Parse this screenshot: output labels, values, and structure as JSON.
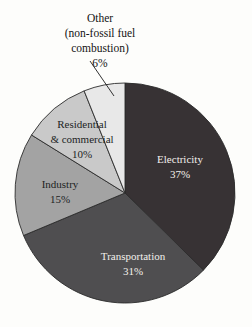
{
  "chart_data": {
    "type": "pie",
    "title": "",
    "subtitle": "",
    "xlabel": "",
    "ylabel": "",
    "legend_position": "none",
    "grid": false,
    "start_angle_deg": 0,
    "direction": "clockwise",
    "unit": "%",
    "categories": [
      "Electricity",
      "Transportation",
      "Industry",
      "Residential & commercial",
      "Other (non-fossil fuel combustion)"
    ],
    "values": [
      37,
      31,
      15,
      10,
      6
    ],
    "slices": [
      {
        "id": "electricity",
        "label": "Electricity",
        "value": 37,
        "value_label": "37%",
        "color": "#373234",
        "text_color": "#f2f0ec",
        "label_placement": "inside"
      },
      {
        "id": "transportation",
        "label": "Transportation",
        "value": 31,
        "value_label": "31%",
        "color": "#4f4e50",
        "text_color": "#f2f0ec",
        "label_placement": "inside"
      },
      {
        "id": "industry",
        "label": "Industry",
        "value": 15,
        "value_label": "15%",
        "color": "#a3a3a3",
        "text_color": "#211f1f",
        "label_placement": "inside"
      },
      {
        "id": "residential-commercial",
        "label": "Residential",
        "label_line2": "& commercial",
        "value": 10,
        "value_label": "10%",
        "color": "#c9c9c9",
        "text_color": "#211f1f",
        "label_placement": "inside"
      },
      {
        "id": "other",
        "label": "Other",
        "label_line2": "(non-fossil fuel",
        "label_line3": "combustion)",
        "value": 6,
        "value_label": "6%",
        "color": "#e8e8e8",
        "text_color": "#141414",
        "label_placement": "outside-with-leader"
      }
    ]
  },
  "labels": {
    "electricity_name": "Electricity",
    "electricity_value": "37%",
    "transportation_name": "Transportation",
    "transportation_value": "31%",
    "industry_name": "Industry",
    "industry_value": "15%",
    "residential_name": "Residential",
    "residential_name2": "& commercial",
    "residential_value": "10%",
    "other_name": "Other",
    "other_name2": "(non-fossil fuel",
    "other_name3": "combustion)",
    "other_value": "6%"
  },
  "colors": {
    "background": "#fdfdfb",
    "outline": "#2b2b2b",
    "electricity": "#373234",
    "transportation": "#4f4e50",
    "industry": "#a3a3a3",
    "residential": "#c9c9c9",
    "other": "#e8e8e8"
  }
}
